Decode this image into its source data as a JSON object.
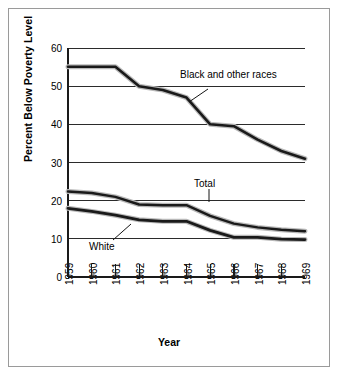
{
  "figure": {
    "frame_border_color": "#9a9a9a",
    "background": "#ffffff"
  },
  "axis": {
    "y_title": "Percent Below Poverty Level",
    "x_title": "Year",
    "y_ticks": [
      "0",
      "10",
      "20",
      "30",
      "40",
      "50",
      "60"
    ],
    "x_ticks": [
      "1959",
      "1960",
      "1961",
      "1962",
      "1963",
      "1964",
      "1965",
      "1966",
      "1967",
      "1968",
      "1969"
    ]
  },
  "annotations": [
    {
      "name": "black-and-other-races-label",
      "text": "Black and other races"
    },
    {
      "name": "total-label",
      "text": "Total"
    },
    {
      "name": "white-label",
      "text": "White"
    }
  ],
  "chart_data": {
    "type": "line",
    "title": "",
    "xlabel": "Year",
    "ylabel": "Percent Below Poverty Level",
    "x": [
      1959,
      1960,
      1961,
      1962,
      1963,
      1964,
      1965,
      1966,
      1967,
      1968,
      1969
    ],
    "categories": [
      "1959",
      "1960",
      "1961",
      "1962",
      "1963",
      "1964",
      "1965",
      "1966",
      "1967",
      "1968",
      "1969"
    ],
    "ylim": [
      0,
      60
    ],
    "xlim": [
      1959,
      1969
    ],
    "grid": "horizontal",
    "legend": "inline-annotations",
    "series": [
      {
        "name": "Black and other races",
        "color": "#1a1a1a",
        "values": [
          55.1,
          55.1,
          55.1,
          50.0,
          49.0,
          47.0,
          40.0,
          39.5,
          36.0,
          33.0,
          31.0
        ]
      },
      {
        "name": "Total",
        "color": "#1a1a1a",
        "values": [
          22.4,
          22.0,
          21.0,
          19.0,
          18.8,
          18.8,
          16.0,
          14.0,
          13.0,
          12.4,
          12.0
        ]
      },
      {
        "name": "White",
        "color": "#1a1a1a",
        "values": [
          18.0,
          17.2,
          16.2,
          15.0,
          14.6,
          14.6,
          12.2,
          10.4,
          10.4,
          9.9,
          9.8
        ]
      }
    ]
  }
}
